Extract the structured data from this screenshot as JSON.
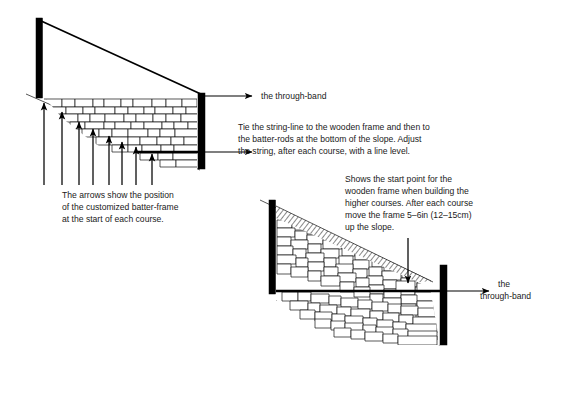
{
  "figure": {
    "background_color": "#ffffff",
    "ink_color": "#000000"
  },
  "labels": {
    "through_band_top": "the through-band",
    "through_band_bottom_line1": "the",
    "through_band_bottom_line2": "through-band"
  },
  "captions": {
    "string_line": {
      "lines": [
        "Tie the string-line to the wooden frame and then to",
        "the batter-rods at the bottom of the slope. Adjust",
        "the string, after each course, with a line level."
      ]
    },
    "arrows": {
      "lines": [
        "The arrows show the position",
        "of the customized batter-frame",
        "at the start of each course."
      ]
    },
    "start_point": {
      "lines": [
        "Shows the start point for the",
        "wooden frame when building the",
        "higher courses. After each course",
        "move the frame 5–6in (12–15cm)",
        "up the slope."
      ]
    }
  },
  "upper_diagram": {
    "left_post": {
      "x": 36,
      "y": 18,
      "width": 6.5,
      "height": 80
    },
    "right_post": {
      "x": 198,
      "y": 93,
      "width": 7,
      "height": 76
    },
    "string_line": {
      "x1": 39,
      "y1": 20,
      "x2": 202,
      "y2": 95
    },
    "batter_arrow_count": 8,
    "batter_arrow_x": [
      44,
      62,
      79,
      93,
      109,
      122,
      136,
      152
    ],
    "batter_arrow_tip_y": [
      101,
      110,
      120,
      127,
      134,
      140,
      145,
      152
    ],
    "batter_arrow_base_y": 185,
    "through_band_y": 152,
    "ground_line": {
      "x1": 28,
      "y1": 95,
      "x2": 200,
      "y2": 170
    }
  },
  "lower_diagram": {
    "left_post": {
      "x": 269,
      "y": 200,
      "width": 6.5,
      "height": 94
    },
    "right_post": {
      "x": 440,
      "y": 265,
      "width": 7,
      "height": 80
    },
    "down_arrow": {
      "x": 408,
      "y1": 238,
      "y2": 283
    },
    "through_band_y": 291,
    "wedge_top": {
      "x1": 272,
      "y1": 205,
      "x2": 430,
      "y2": 280
    }
  }
}
